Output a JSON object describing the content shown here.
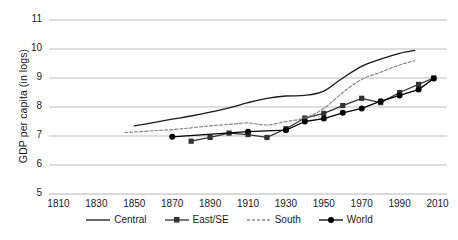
{
  "chart_data": {
    "type": "line",
    "title": "",
    "xlabel": "",
    "ylabel": "GDP per capita (in logs)",
    "xlim": [
      1805,
      2015
    ],
    "ylim": [
      5,
      11
    ],
    "grid": true,
    "legend_position": "bottom",
    "y_ticks": [
      "11",
      "10",
      "9",
      "8",
      "7",
      "6",
      "5"
    ],
    "x_ticks": [
      "1810",
      "1830",
      "1850",
      "1870",
      "1890",
      "1910",
      "1930",
      "1950",
      "1970",
      "1990",
      "2010"
    ],
    "series": [
      {
        "name": "Central",
        "style": "solid",
        "marker": "none",
        "color": "#1a1a1a",
        "x": [
          1850,
          1860,
          1870,
          1880,
          1890,
          1900,
          1910,
          1920,
          1930,
          1940,
          1950,
          1960,
          1970,
          1980,
          1990,
          1998
        ],
        "values": [
          7.35,
          7.46,
          7.58,
          7.69,
          7.82,
          7.97,
          8.15,
          8.3,
          8.38,
          8.4,
          8.55,
          9.0,
          9.4,
          9.65,
          9.85,
          9.95
        ]
      },
      {
        "name": "East/SE",
        "style": "solid",
        "marker": "square",
        "color": "#333333",
        "x": [
          1880,
          1890,
          1900,
          1910,
          1920,
          1930,
          1940,
          1950,
          1960,
          1970,
          1980,
          1990,
          2000,
          2008
        ],
        "values": [
          6.82,
          6.95,
          7.1,
          7.05,
          6.95,
          7.25,
          7.62,
          7.78,
          8.05,
          8.3,
          8.15,
          8.5,
          8.78,
          9.0
        ]
      },
      {
        "name": "South",
        "style": "dotted",
        "marker": "none",
        "color": "#888888",
        "x": [
          1845,
          1860,
          1870,
          1880,
          1890,
          1900,
          1910,
          1920,
          1930,
          1940,
          1950,
          1960,
          1970,
          1980,
          1990,
          1998
        ],
        "values": [
          7.12,
          7.18,
          7.22,
          7.28,
          7.35,
          7.4,
          7.45,
          7.38,
          7.5,
          7.62,
          7.95,
          8.5,
          8.95,
          9.2,
          9.45,
          9.6
        ]
      },
      {
        "name": "World",
        "style": "solid",
        "marker": "circle",
        "color": "#000000",
        "x": [
          1870,
          1910,
          1930,
          1940,
          1950,
          1960,
          1970,
          1980,
          1990,
          2000,
          2008
        ],
        "values": [
          6.97,
          7.15,
          7.2,
          7.5,
          7.6,
          7.8,
          7.95,
          8.2,
          8.4,
          8.6,
          8.98
        ]
      }
    ]
  },
  "legend": {
    "items": [
      {
        "label": "Central",
        "key": "Central"
      },
      {
        "label": "East/SE",
        "key": "East/SE"
      },
      {
        "label": "South",
        "key": "South"
      },
      {
        "label": "World",
        "key": "World"
      }
    ]
  },
  "colors": {
    "gridline": "#b5b5b5",
    "axis_text": "#1a1a1a",
    "central": "#1a1a1a",
    "east_se": "#333333",
    "south": "#888888",
    "world": "#000000"
  }
}
